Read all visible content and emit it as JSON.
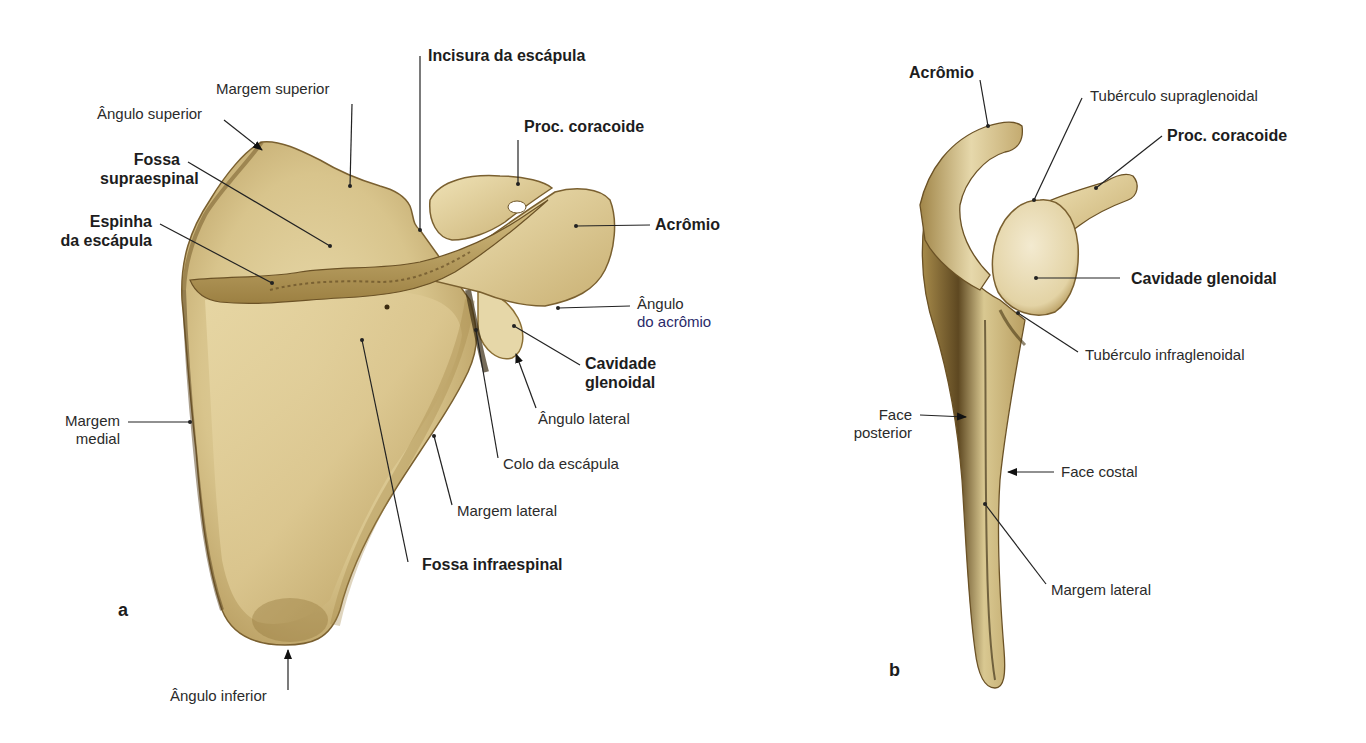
{
  "figure": {
    "colors": {
      "bone_light": "#ebdcae",
      "bone_mid": "#cdb578",
      "bone_dark": "#8a6e34",
      "bone_shadow": "#5a4420",
      "leader_line": "#222222",
      "background": "#ffffff"
    },
    "panel_a": {
      "letter": "a",
      "labels": {
        "margem_superior": "Margem superior",
        "angulo_superior": "Ângulo superior",
        "fossa_supraespinal_1": "Fossa",
        "fossa_supraespinal_2": "supraespinal",
        "espinha_1": "Espinha",
        "espinha_2": "da escápula",
        "incisura": "Incisura da escápula",
        "proc_coracoide": "Proc. coracoide",
        "acromio": "Acrômio",
        "angulo_acromio_1": "Ângulo",
        "angulo_acromio_2": "do acrômio",
        "cavidade_1": "Cavidade",
        "cavidade_2": "glenoidal",
        "angulo_lateral": "Ângulo lateral",
        "colo": "Colo da escápula",
        "margem_medial_1": "Margem",
        "margem_medial_2": "medial",
        "margem_lateral": "Margem lateral",
        "fossa_infraespinal": "Fossa infraespinal",
        "angulo_inferior": "Ângulo inferior"
      }
    },
    "panel_b": {
      "letter": "b",
      "labels": {
        "acromio": "Acrômio",
        "tuberculo_supra": "Tubérculo supraglenoidal",
        "proc_coracoide": "Proc. coracoide",
        "cavidade": "Cavidade glenoidal",
        "tuberculo_infra": "Tubérculo infraglenoidal",
        "face_posterior_1": "Face",
        "face_posterior_2": "posterior",
        "face_costal": "Face costal",
        "margem_lateral": "Margem lateral"
      }
    }
  }
}
